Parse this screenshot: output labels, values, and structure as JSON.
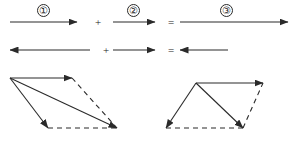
{
  "figure": {
    "background_color": "#ffffff",
    "stroke_color": "#2a2a2a",
    "width": 295,
    "height": 148
  },
  "equations": [
    {
      "row": 1,
      "y": 22,
      "terms": [
        {
          "kind": "vector",
          "label": "①",
          "direction": "right",
          "x1": 10,
          "x2": 77,
          "label_x": 37,
          "label_y": 4
        },
        {
          "kind": "operator",
          "symbol": "+",
          "x": 92,
          "y": 17
        },
        {
          "kind": "vector",
          "label": "②",
          "direction": "right",
          "x1": 113,
          "x2": 155,
          "label_x": 127,
          "label_y": 4
        },
        {
          "kind": "operator",
          "symbol": "=",
          "x": 165,
          "y": 17
        },
        {
          "kind": "vector",
          "label": "③",
          "direction": "right",
          "x1": 180,
          "x2": 288,
          "label_x": 220,
          "label_y": 4
        }
      ]
    },
    {
      "row": 2,
      "y": 50,
      "terms": [
        {
          "kind": "vector",
          "label": "",
          "direction": "left",
          "x1": 10,
          "x2": 90,
          "label_x": 0,
          "label_y": 0
        },
        {
          "kind": "operator",
          "symbol": "+",
          "x": 100,
          "y": 45
        },
        {
          "kind": "vector",
          "label": "",
          "direction": "right",
          "x1": 113,
          "x2": 155,
          "label_x": 0,
          "label_y": 0
        },
        {
          "kind": "operator",
          "symbol": "=",
          "x": 165,
          "y": 45
        },
        {
          "kind": "vector",
          "label": "",
          "direction": "left",
          "x1": 180,
          "x2": 228,
          "label_x": 0,
          "label_y": 0
        }
      ]
    }
  ],
  "diagrams": [
    {
      "name": "parallelogram-left",
      "origin": {
        "x": 10,
        "y": 78
      },
      "solid_vectors": [
        {
          "name": "component-a",
          "x1": 10,
          "y1": 78,
          "x2": 72,
          "y2": 78
        },
        {
          "name": "component-b",
          "x1": 10,
          "y1": 78,
          "x2": 48,
          "y2": 128
        },
        {
          "name": "resultant",
          "x1": 10,
          "y1": 78,
          "x2": 117,
          "y2": 128
        }
      ],
      "dashed_edges": [
        {
          "name": "edge-right",
          "x1": 72,
          "y1": 78,
          "x2": 117,
          "y2": 128
        },
        {
          "name": "edge-bottom",
          "x1": 48,
          "y1": 128,
          "x2": 117,
          "y2": 128
        }
      ]
    },
    {
      "name": "triangle-right",
      "origin": {
        "x": 196,
        "y": 83
      },
      "solid_vectors": [
        {
          "name": "component-a",
          "x1": 196,
          "y1": 83,
          "x2": 166,
          "y2": 128
        },
        {
          "name": "component-b",
          "x1": 196,
          "y1": 83,
          "x2": 243,
          "y2": 128
        },
        {
          "name": "resultant",
          "x1": 196,
          "y1": 83,
          "x2": 263,
          "y2": 83
        }
      ],
      "dashed_edges": [
        {
          "name": "edge-bottom",
          "x1": 166,
          "y1": 128,
          "x2": 243,
          "y2": 128
        },
        {
          "name": "edge-right",
          "x1": 243,
          "y1": 128,
          "x2": 263,
          "y2": 83
        }
      ]
    }
  ]
}
